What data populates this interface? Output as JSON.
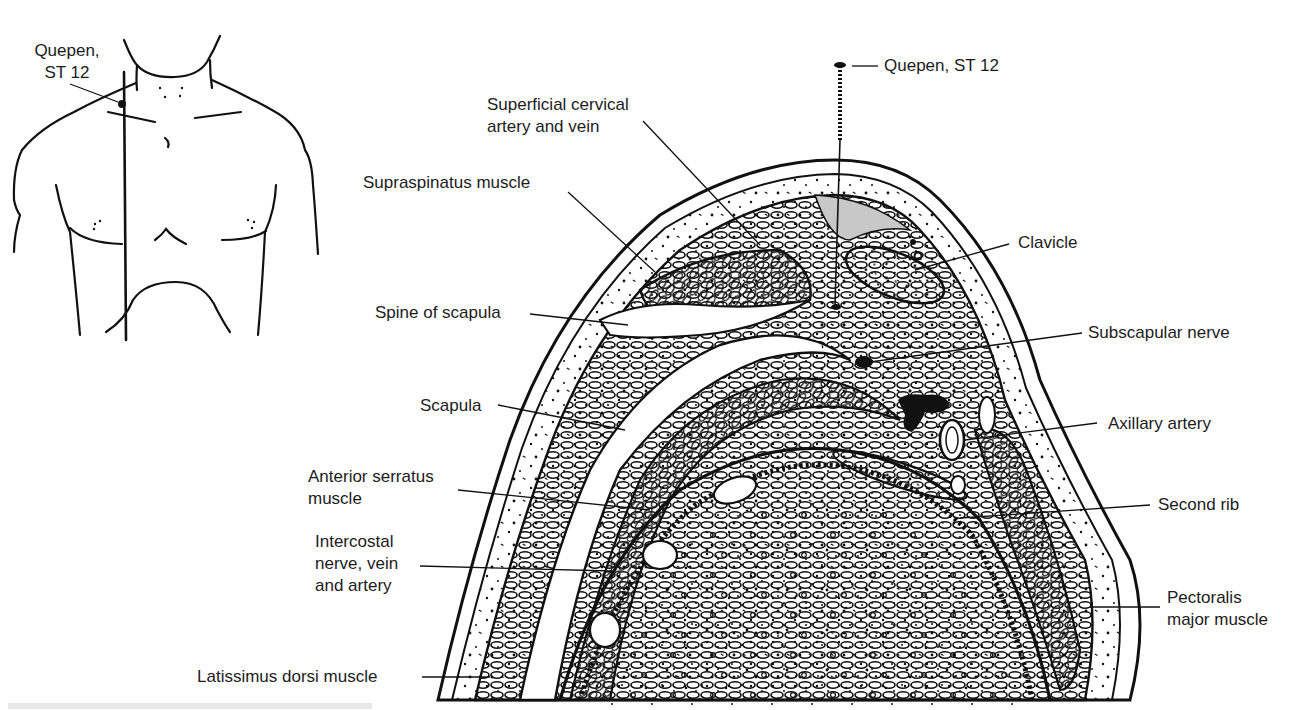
{
  "figure": {
    "inset": {
      "title_line1": "Quepen,",
      "title_line2": "ST 12",
      "description": "Anterior view of chest showing acupoint location"
    },
    "needle_label": "Quepen, ST 12",
    "labels_left": [
      {
        "id": "superficial-cervical",
        "lines": [
          "Superficial cervical",
          "artery and vein"
        ]
      },
      {
        "id": "supraspinatus",
        "lines": [
          "Supraspinatus muscle"
        ]
      },
      {
        "id": "spine-of-scapula",
        "lines": [
          "Spine of scapula"
        ]
      },
      {
        "id": "scapula",
        "lines": [
          "Scapula"
        ]
      },
      {
        "id": "anterior-serratus",
        "lines": [
          "Anterior serratus",
          "muscle"
        ]
      },
      {
        "id": "intercostal",
        "lines": [
          "Intercostal",
          "nerve, vein",
          "and artery"
        ]
      },
      {
        "id": "latissimus-dorsi",
        "lines": [
          "Latissimus dorsi muscle"
        ]
      }
    ],
    "labels_right": [
      {
        "id": "clavicle",
        "lines": [
          "Clavicle"
        ]
      },
      {
        "id": "subscapular-nerve",
        "lines": [
          "Subscapular nerve"
        ]
      },
      {
        "id": "axillary-artery",
        "lines": [
          "Axillary artery"
        ]
      },
      {
        "id": "second-rib",
        "lines": [
          "Second rib"
        ]
      },
      {
        "id": "pectoralis-major",
        "lines": [
          "Pectoralis",
          "major muscle"
        ]
      }
    ]
  }
}
